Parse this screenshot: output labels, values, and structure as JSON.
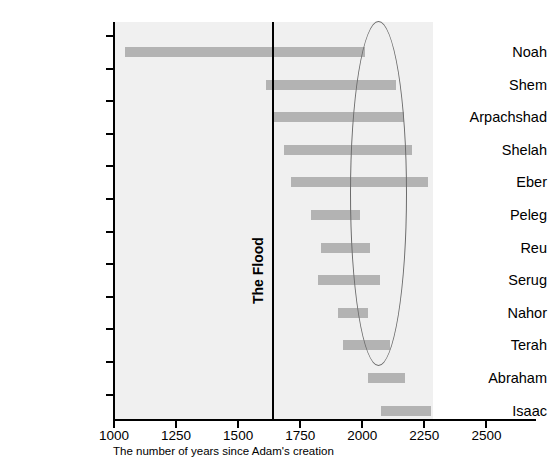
{
  "chart_data": {
    "type": "bar",
    "orientation": "horizontal",
    "title": "",
    "subtitle": "",
    "xlabel": "The number of years since Adam's creation",
    "ylabel": "",
    "xlim": [
      1000,
      2700
    ],
    "xticks": [
      1000,
      1250,
      1500,
      1750,
      2000,
      2250,
      2500
    ],
    "xtick_labels": [
      "1000",
      "1250",
      "1500",
      "1750",
      "2000",
      "2250",
      "2500"
    ],
    "grid": false,
    "legend": null,
    "bar_color": "#b3b3b3",
    "plot_background": "#f0f0f0",
    "categories": [
      "Noah",
      "Shem",
      "Arpachshad",
      "Shelah",
      "Eber",
      "Peleg",
      "Reu",
      "Serug",
      "Nahor",
      "Terah",
      "Abraham",
      "Isaac"
    ],
    "spans": [
      {
        "name": "Noah",
        "start": 1048,
        "end": 2016
      },
      {
        "name": "Shem",
        "start": 1617,
        "end": 2141
      },
      {
        "name": "Arpachshad",
        "start": 1649,
        "end": 2173
      },
      {
        "name": "Shelah",
        "start": 1690,
        "end": 2206
      },
      {
        "name": "Eber",
        "start": 1718,
        "end": 2267
      },
      {
        "name": "Peleg",
        "start": 1799,
        "end": 1996
      },
      {
        "name": "Reu",
        "start": 1839,
        "end": 2036
      },
      {
        "name": "Serug",
        "start": 1827,
        "end": 2076
      },
      {
        "name": "Nahor",
        "start": 1907,
        "end": 2028
      },
      {
        "name": "Terah",
        "start": 1927,
        "end": 2117
      },
      {
        "name": "Abraham",
        "start": 2028,
        "end": 2178
      },
      {
        "name": "Isaac",
        "start": 2078,
        "end": 2280
      }
    ],
    "annotations": [
      {
        "type": "vertical-line",
        "label": "The Flood",
        "value": 1642,
        "color": "#000000"
      },
      {
        "type": "ellipse",
        "label": "",
        "x_range": [
          1954,
          2183
        ],
        "y_range": [
          "Noah",
          "Terah"
        ],
        "color": "#6b6b6b"
      }
    ]
  },
  "axis": {
    "flood_label": "The Flood",
    "caption": "The number of years since Adam's creation"
  }
}
